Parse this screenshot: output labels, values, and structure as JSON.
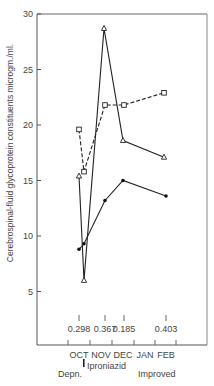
{
  "chart_data": {
    "type": "line",
    "title": "",
    "ylabel": "Cerebrospinal-fluid glycoprotein constituents microgm./ml.",
    "xlabel": "",
    "ylim": [
      0,
      30
    ],
    "yticks": [
      "5",
      "10",
      "15",
      "20",
      "25",
      "30"
    ],
    "xticks": [
      "OCT",
      "NOV",
      "DEC",
      "JAN",
      "FEB"
    ],
    "grid": false,
    "legend": "none",
    "series": [
      {
        "name": "triangles",
        "marker": "open-triangle",
        "line": "solid",
        "x": [
          79,
          84,
          104,
          123,
          164
        ],
        "values": [
          15.4,
          6.0,
          28.7,
          18.6,
          17.1
        ]
      },
      {
        "name": "squares",
        "marker": "open-square",
        "line": "dashed",
        "x": [
          79,
          84,
          105,
          124,
          164
        ],
        "values": [
          19.6,
          15.8,
          21.8,
          21.8,
          22.9
        ]
      },
      {
        "name": "dots",
        "marker": "filled-circle",
        "line": "solid",
        "x": [
          79,
          84,
          105,
          123,
          166
        ],
        "values": [
          8.8,
          9.3,
          13.2,
          15.0,
          13.6
        ]
      }
    ],
    "annotations": {
      "values": [
        {
          "label": "0.298",
          "x": 79
        },
        {
          "label": "0.367",
          "x": 105
        },
        {
          "label": "0.185",
          "x": 124
        },
        {
          "label": "0.403",
          "x": 166
        }
      ],
      "phases": [
        "Depn.",
        "Iproniazid",
        "Improved"
      ]
    }
  }
}
